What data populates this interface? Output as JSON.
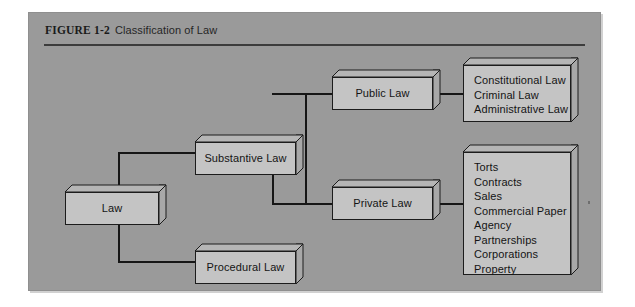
{
  "figure": {
    "label": "FIGURE 1-2",
    "title": "Classification of Law"
  },
  "colors": {
    "panel_background": "#9a9a9a",
    "box_face": "#c4c4c4",
    "box_side": "#a3a3a3",
    "line": "#161616",
    "text": "#141414",
    "page_background": "#ffffff"
  },
  "nodes": {
    "law": {
      "label": "Law"
    },
    "substantive_law": {
      "label": "Substantive Law"
    },
    "procedural_law": {
      "label": "Procedural Law"
    },
    "public_law": {
      "label": "Public Law"
    },
    "private_law": {
      "label": "Private Law"
    },
    "public_law_items": {
      "items": [
        "Constitutional Law",
        "Criminal Law",
        "Administrative Law"
      ]
    },
    "private_law_items": {
      "items": [
        "Torts",
        "Contracts",
        "Sales",
        "Commercial Paper",
        "Agency",
        "Partnerships",
        "Corporations",
        "Property"
      ]
    }
  },
  "hierarchy": {
    "root": "Law",
    "branches": [
      {
        "from": "Law",
        "to": "Substantive Law",
        "children": [
          {
            "from": "Substantive Law",
            "to": "Public Law",
            "leaf_list": "public_law_items"
          },
          {
            "from": "Substantive Law",
            "to": "Private Law",
            "leaf_list": "private_law_items"
          }
        ]
      },
      {
        "from": "Law",
        "to": "Procedural Law",
        "children": []
      }
    ]
  }
}
